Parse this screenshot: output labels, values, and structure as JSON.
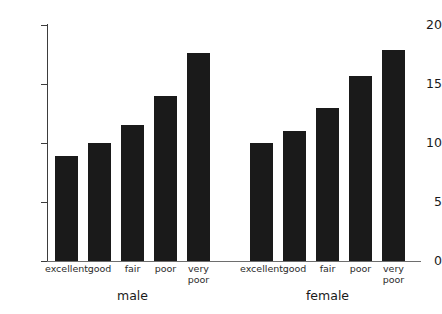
{
  "chart_data": {
    "type": "bar",
    "title": "",
    "subtitle": "",
    "xlabel": "",
    "ylabel": "mean of ghqscale",
    "ylim": [
      0,
      20
    ],
    "yticks": [
      "0",
      "5",
      "10",
      "15",
      "20"
    ],
    "grid": false,
    "legend": false,
    "bar_color": "#1a1a1a",
    "axis_color": "#3d3d3d",
    "categories": [
      "excellent",
      "good",
      "fair",
      "poor",
      "very\npoor"
    ],
    "groups": [
      {
        "name": "male",
        "label": "male",
        "categories": [
          "excellent",
          "good",
          "fair",
          "poor",
          "very\npoor"
        ],
        "values": [
          8.9,
          10.0,
          11.5,
          14.0,
          17.6
        ]
      },
      {
        "name": "female",
        "label": "female",
        "categories": [
          "excellent",
          "good",
          "fair",
          "poor",
          "very\npoor"
        ],
        "values": [
          10.0,
          11.0,
          13.0,
          15.7,
          17.9
        ]
      }
    ]
  },
  "axis": {
    "y_title": "mean of ghqscale",
    "y_ticks": [
      {
        "label": "20",
        "value": 20
      },
      {
        "label": "15",
        "value": 15
      },
      {
        "label": "10",
        "value": 10
      },
      {
        "label": "5",
        "value": 5
      },
      {
        "label": "0",
        "value": 0
      }
    ]
  },
  "bars": [
    {
      "label": "excellent",
      "group": "male",
      "value": 8.9
    },
    {
      "label": "good",
      "group": "male",
      "value": 10.0
    },
    {
      "label": "fair",
      "group": "male",
      "value": 11.5
    },
    {
      "label": "poor",
      "group": "male",
      "value": 14.0
    },
    {
      "label": "very\npoor",
      "group": "male",
      "value": 17.6
    },
    {
      "label": "excellent",
      "group": "female",
      "value": 10.0
    },
    {
      "label": "good",
      "group": "female",
      "value": 11.0
    },
    {
      "label": "fair",
      "group": "female",
      "value": 13.0
    },
    {
      "label": "poor",
      "group": "female",
      "value": 15.7
    },
    {
      "label": "very\npoor",
      "group": "female",
      "value": 17.9
    }
  ],
  "group_labels": [
    {
      "label": "male"
    },
    {
      "label": "female"
    }
  ]
}
